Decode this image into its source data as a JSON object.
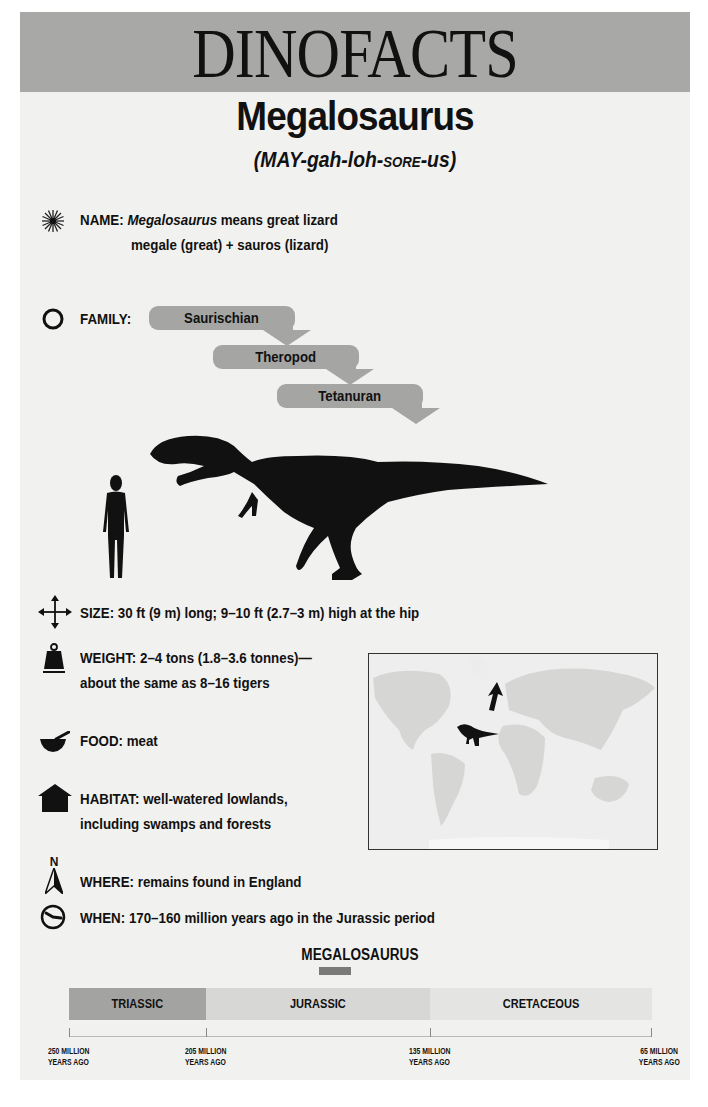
{
  "banner": {
    "title": "DINOFACTS",
    "bg_color": "#a8a8a6"
  },
  "dinosaur": {
    "name": "Megalosaurus",
    "pronunciation": {
      "part1": "(MAY-gah-loh-",
      "small_caps": "SORE",
      "part2": "-us)"
    }
  },
  "facts": {
    "name": {
      "icon": "starburst-icon",
      "label": "NAME:",
      "italic": "Megalosaurus",
      "text": " means great lizard",
      "line2": "megale (great) + sauros (lizard)"
    },
    "family": {
      "icon": "circle-icon",
      "label": "FAMILY:",
      "levels": [
        {
          "label": "Saurischian"
        },
        {
          "label": "Theropod"
        },
        {
          "label": "Tetanuran"
        }
      ]
    },
    "size": {
      "icon": "four-way-arrow-icon",
      "label": "SIZE:",
      "text": " 30 ft (9 m) long; 9–10 ft (2.7–3 m) high at the hip"
    },
    "weight": {
      "icon": "weight-icon",
      "label": "WEIGHT:",
      "text": " 2–4 tons (1.8–3.6 tonnes)—",
      "line2": "about the same as 8–16 tigers"
    },
    "food": {
      "icon": "mortar-pestle-icon",
      "label": "FOOD:",
      "text": " meat"
    },
    "habitat": {
      "icon": "house-icon",
      "label": "HABITAT:",
      "text": " well-watered lowlands,",
      "line2": "including swamps and forests"
    },
    "where": {
      "icon": "north-arrow-icon",
      "icon_letter": "N",
      "label": "WHERE:",
      "text": " remains found in England"
    },
    "when": {
      "icon": "clock-icon",
      "label": "WHEN:",
      "text": " 170–160 million years ago in the Jurassic period"
    }
  },
  "timeline": {
    "title": "MEGALOSAURUS",
    "periods": [
      {
        "label": "TRIASSIC",
        "color": "#a3a3a1"
      },
      {
        "label": "JURASSIC",
        "color": "#d7d7d5"
      },
      {
        "label": "CRETACEOUS",
        "color": "#e4e4e2"
      }
    ],
    "ticks": [
      {
        "line1": "250 MILLION",
        "line2": "YEARS AGO"
      },
      {
        "line1": "205 MILLION",
        "line2": "YEARS AGO"
      },
      {
        "line1": "135 MILLION",
        "line2": "YEARS AGO"
      },
      {
        "line1": "65 MILLION",
        "line2": "YEARS AGO"
      }
    ],
    "marker_color": "#7a7a78"
  }
}
